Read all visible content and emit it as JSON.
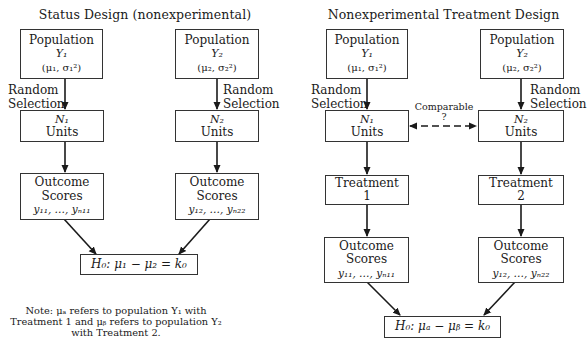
{
  "left_panel": {
    "title": "Status Design (nonexperimental)",
    "population_1": {
      "label": "Population",
      "variable": "Y₁",
      "params": "(μ₁, σ₁²)"
    },
    "population_2": {
      "label": "Population",
      "variable": "Y₂",
      "params": "(μ₂, σ₂²)"
    },
    "selection_1": {
      "line1": "Random",
      "line2": "Selection"
    },
    "selection_2": {
      "line1": "Random",
      "line2": "Selection"
    },
    "units_1": {
      "count": "N₁",
      "label": "Units"
    },
    "units_2": {
      "count": "N₂",
      "label": "Units"
    },
    "outcome_1": {
      "line1": "Outcome",
      "line2": "Scores",
      "values": "y₁₁, …, yₙ₁₁"
    },
    "outcome_2": {
      "line1": "Outcome",
      "line2": "Scores",
      "values": "y₁₂, …, yₙ₂₂"
    },
    "hypothesis": "H₀: μ₁ − μ₂ = k₀"
  },
  "right_panel": {
    "title": "Nonexperimental Treatment Design",
    "population_1": {
      "label": "Population",
      "variable": "Y₁",
      "params": "(μ₁, σ₁²)"
    },
    "population_2": {
      "label": "Population",
      "variable": "Y₂",
      "params": "(μ₂, σ₂²)"
    },
    "selection_1": {
      "line1": "Random",
      "line2": "Selection"
    },
    "selection_2": {
      "line1": "Random",
      "line2": "Selection"
    },
    "comparable": {
      "line1": "Comparable",
      "line2": "?"
    },
    "units_1": {
      "count": "N₁",
      "label": "Units"
    },
    "units_2": {
      "count": "N₂",
      "label": "Units"
    },
    "treatment_1": {
      "label": "Treatment",
      "number": "1"
    },
    "treatment_2": {
      "label": "Treatment",
      "number": "2"
    },
    "outcome_1": {
      "line1": "Outcome",
      "line2": "Scores",
      "values": "y₁₁, …, yₙ₁₁"
    },
    "outcome_2": {
      "line1": "Outcome",
      "line2": "Scores",
      "values": "y₁₂, …, yₙ₂₂"
    },
    "hypothesis": "H₀: μₐ − μᵦ = k₀"
  },
  "note": {
    "line1": "Note: μₐ refers to population Y₁ with",
    "line2": "Treatment 1 and μᵦ refers to population Y₂",
    "line3": "with Treatment 2."
  },
  "colors": {
    "line": "#1a1a1a",
    "border": "#333333",
    "background": "#ffffff"
  }
}
